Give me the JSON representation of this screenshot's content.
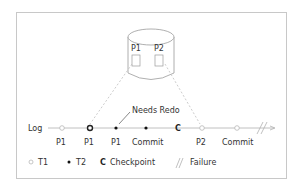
{
  "diagram": {
    "disk": {
      "pages": [
        {
          "label": "P1"
        },
        {
          "label": "P2"
        }
      ]
    },
    "log": {
      "label": "Log",
      "entries": [
        {
          "label": "P1",
          "type": "T1"
        },
        {
          "label": "P1",
          "type": "T1-bold"
        },
        {
          "label": "P1",
          "type": "T2"
        },
        {
          "label": "Commit",
          "type": "T2"
        },
        {
          "label": "",
          "type": "Checkpoint",
          "glyph": "C"
        },
        {
          "label": "P2",
          "type": "T1"
        },
        {
          "label": "Commit",
          "type": "T1"
        }
      ],
      "annotation": "Needs Redo"
    },
    "legend": [
      {
        "symbol": "hollow-circle",
        "label": "T1"
      },
      {
        "symbol": "filled-dot",
        "label": "T2"
      },
      {
        "symbol": "C",
        "label": "Checkpoint"
      },
      {
        "symbol": "slash",
        "label": "Failure"
      }
    ],
    "colors": {
      "line": "#b0b0b0",
      "dashed": "#bfbfbf",
      "text": "#333333",
      "border": "#c8c8c8"
    }
  }
}
